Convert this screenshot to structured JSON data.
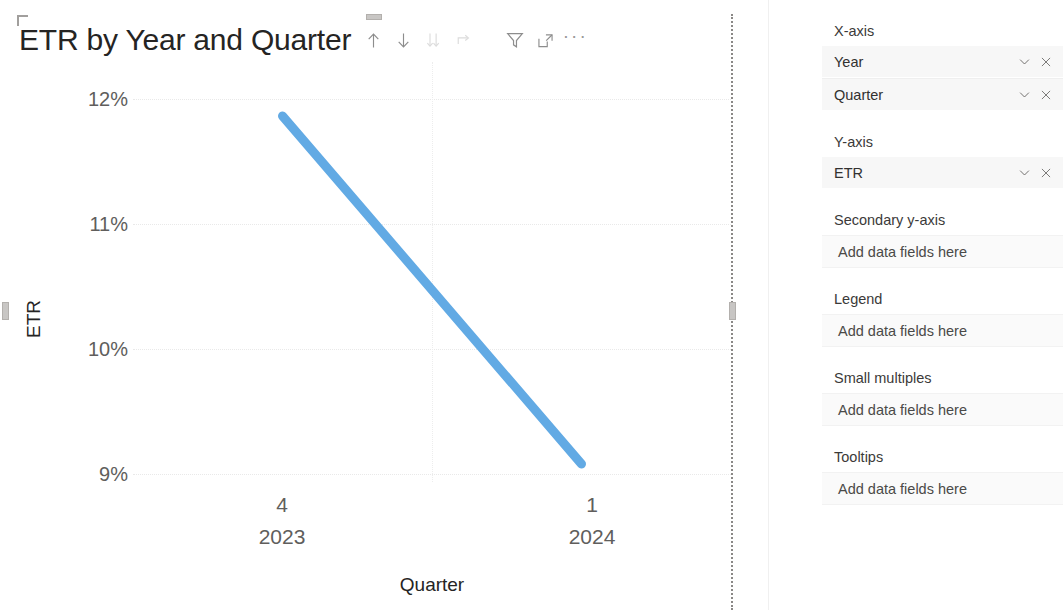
{
  "visual": {
    "title": "ETR by Year and Quarter",
    "toolbar": [
      {
        "name": "drill-up-icon",
        "label": "Drill up",
        "dim": false
      },
      {
        "name": "drill-down-icon",
        "label": "Drill down",
        "dim": false
      },
      {
        "name": "expand-hierarchy-icon",
        "label": "Expand all down one level in the hierarchy",
        "dim": true
      },
      {
        "name": "drill-mode-icon",
        "label": "Go to the next level in the hierarchy",
        "dim": true
      },
      {
        "name": "filter-icon",
        "label": "Filters",
        "dim": false
      },
      {
        "name": "focus-mode-icon",
        "label": "Focus mode",
        "dim": false
      },
      {
        "name": "more-options-icon",
        "label": "More options",
        "dim": false
      }
    ]
  },
  "chart_data": {
    "type": "line",
    "title": "ETR by Year and Quarter",
    "xlabel": "Quarter",
    "ylabel": "ETR",
    "categories": [
      "4 2023",
      "1 2024"
    ],
    "x_tick_groups": [
      {
        "quarter": "4",
        "year": "2023"
      },
      {
        "quarter": "1",
        "year": "2024"
      }
    ],
    "values": [
      0.118,
      0.089
    ],
    "y_tick_labels": [
      "12%",
      "11%",
      "10%",
      "9%"
    ],
    "y_tick_values": [
      0.12,
      0.11,
      0.1,
      0.09
    ],
    "ylim": [
      0.0875,
      0.1225
    ],
    "grid": true,
    "legend": "none",
    "series_color": "#62aae4",
    "series_name": "ETR"
  },
  "field_panel": {
    "wells": [
      {
        "label": "X-axis",
        "fields": [
          {
            "name": "Year"
          },
          {
            "name": "Quarter"
          }
        ],
        "placeholder": null
      },
      {
        "label": "Y-axis",
        "fields": [
          {
            "name": "ETR"
          }
        ],
        "placeholder": null
      },
      {
        "label": "Secondary y-axis",
        "fields": [],
        "placeholder": "Add data fields here"
      },
      {
        "label": "Legend",
        "fields": [],
        "placeholder": "Add data fields here"
      },
      {
        "label": "Small multiples",
        "fields": [],
        "placeholder": "Add data fields here"
      },
      {
        "label": "Tooltips",
        "fields": [],
        "placeholder": "Add data fields here"
      }
    ]
  }
}
